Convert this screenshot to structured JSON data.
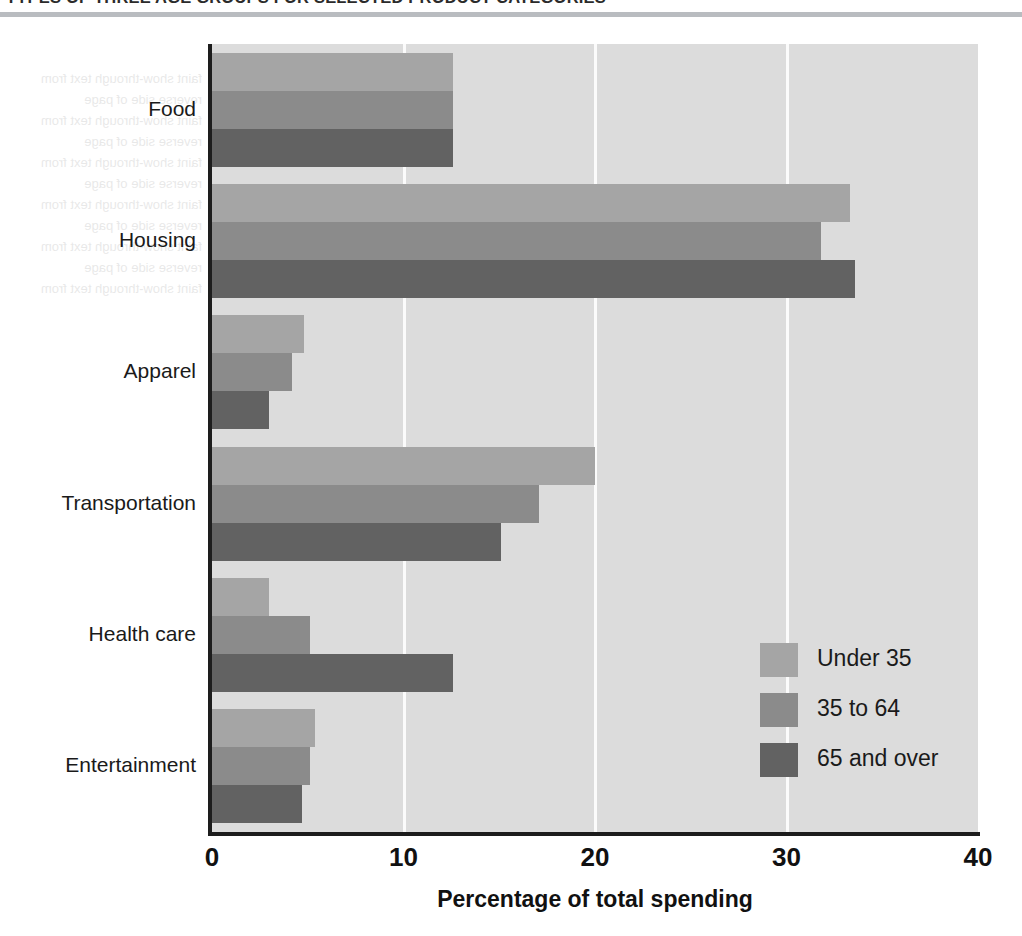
{
  "header": {
    "title": "TYPES OF THREE AGE GROUPS FOR SELECTED PRODUCT CATEGORIES"
  },
  "chart_data": {
    "type": "bar",
    "orientation": "horizontal",
    "title": "TYPES OF THREE AGE GROUPS FOR SELECTED PRODUCT CATEGORIES",
    "xlabel": "Percentage of total spending",
    "ylabel": "",
    "xlim": [
      0,
      40
    ],
    "xticks": [
      0,
      10,
      20,
      30,
      40
    ],
    "xtick_labels": [
      "0",
      "10",
      "20",
      "30",
      "40"
    ],
    "grid": "vertical",
    "legend_position": "inside-lower-right",
    "categories": [
      "Food",
      "Housing",
      "Apparel",
      "Transportation",
      "Health care",
      "Entertainment"
    ],
    "series": [
      {
        "name": "Under 35",
        "color": "#a5a5a5",
        "values": [
          12.6,
          33.3,
          4.8,
          20.0,
          3.0,
          5.4
        ]
      },
      {
        "name": "35 to 64",
        "color": "#8b8b8b",
        "values": [
          12.6,
          31.8,
          4.2,
          17.1,
          5.1,
          5.1
        ]
      },
      {
        "name": "65 and over",
        "color": "#626262",
        "values": [
          12.6,
          33.6,
          3.0,
          15.1,
          12.6,
          4.7
        ]
      }
    ]
  },
  "legend": {
    "items": [
      {
        "label": "Under 35",
        "color": "#a5a5a5"
      },
      {
        "label": "35 to 64",
        "color": "#8b8b8b"
      },
      {
        "label": "65 and over",
        "color": "#626262"
      }
    ]
  },
  "ghost_text": "faint show-through text from reverse side of page"
}
